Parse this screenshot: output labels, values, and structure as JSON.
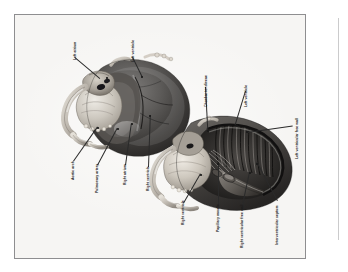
{
  "figure": {
    "kind": "anatomical-illustration",
    "view_count": 2,
    "views": [
      {
        "name": "exterior-heart",
        "description": "intact heart, anterior exterior view"
      },
      {
        "name": "dissected-heart",
        "description": "heart sectioned to expose ventricular chambers"
      }
    ],
    "background_color": "#f6f5f3",
    "frame_color": "#8e8e90",
    "ink_color": "#1b1b1b"
  },
  "labels": [
    {
      "id": "left-atrium",
      "text": "Left atrium"
    },
    {
      "id": "left-ventricle-exterior",
      "text": "Left ventricle"
    },
    {
      "id": "aortic-arch",
      "text": "Aortic arch"
    },
    {
      "id": "pulmonary-artery",
      "text": "Pulmonary artery"
    },
    {
      "id": "right-atrium",
      "text": "Right atrium"
    },
    {
      "id": "right-ventricle-exterior",
      "text": "Right ventricle"
    },
    {
      "id": "chordae-tendineae",
      "text": "Chordae tendineae"
    },
    {
      "id": "left-ventricle-interior",
      "text": "Left ventricle"
    },
    {
      "id": "left-ventricular-free-wall",
      "text": "Left ventricular free wall"
    },
    {
      "id": "right-ventricle-interior",
      "text": "Right ventricle"
    },
    {
      "id": "papillary-muscle",
      "text": "Papillary muscle"
    },
    {
      "id": "right-ventricular-free-wall",
      "text": "Right ventricular free wall"
    },
    {
      "id": "interventricular-septum",
      "text": "Interventricular septum"
    }
  ]
}
